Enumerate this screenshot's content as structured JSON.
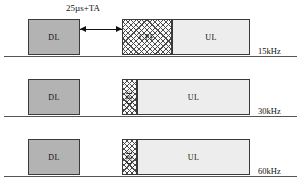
{
  "figure": {
    "annotation": {
      "gap_label": "25µs+TA",
      "arrow_name": "gap-arrow"
    },
    "rows": [
      {
        "id": "row-15khz",
        "freq_label": "15kHz",
        "blocks": [
          {
            "name": "dl-block",
            "label": "DL",
            "kind": "dl",
            "x": 28,
            "w": 52,
            "orientation": "horizontal"
          },
          {
            "name": "cpe-block",
            "label": "CPE",
            "kind": "cpe",
            "x": 122,
            "w": 50,
            "orientation": "horizontal"
          },
          {
            "name": "ul-block",
            "label": "UL",
            "kind": "ul",
            "x": 172,
            "w": 78,
            "orientation": "horizontal"
          }
        ]
      },
      {
        "id": "row-30khz",
        "freq_label": "30kHz",
        "blocks": [
          {
            "name": "dl-block",
            "label": "DL",
            "kind": "dl",
            "x": 28,
            "w": 52,
            "orientation": "horizontal"
          },
          {
            "name": "cpe-block",
            "label": "CPE",
            "kind": "cpe",
            "x": 122,
            "w": 15,
            "orientation": "vertical"
          },
          {
            "name": "ul-block",
            "label": "UL",
            "kind": "ul",
            "x": 137,
            "w": 113,
            "orientation": "horizontal"
          }
        ]
      },
      {
        "id": "row-60khz",
        "freq_label": "60kHz",
        "blocks": [
          {
            "name": "dl-block",
            "label": "DL",
            "kind": "dl",
            "x": 28,
            "w": 52,
            "orientation": "horizontal"
          },
          {
            "name": "cpe-block",
            "label": "CPE",
            "kind": "cpe",
            "x": 122,
            "w": 15,
            "orientation": "vertical"
          },
          {
            "name": "ul-block",
            "label": "UL",
            "kind": "ul",
            "x": 137,
            "w": 113,
            "orientation": "horizontal"
          }
        ]
      }
    ],
    "colors": {
      "dl_fill": "#b3b3b3",
      "ul_fill": "#ededed",
      "cpe_fill": "#fafafa",
      "hatch_stroke": "#4a4a4a",
      "border": "#3a3a3a",
      "baseline": "#555555",
      "text": "#111111"
    }
  }
}
